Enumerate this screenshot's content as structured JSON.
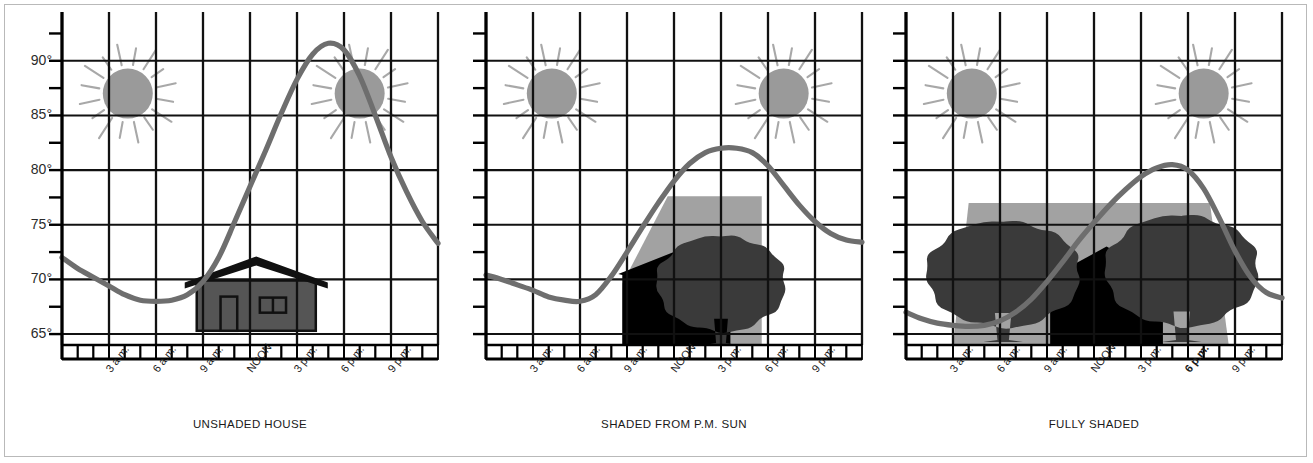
{
  "figure": {
    "title": "",
    "frame_color": "#b9b9b9",
    "background": "#ffffff"
  },
  "colors": {
    "grid": "#111111",
    "axis": "#000000",
    "curve": "#6e6e6e",
    "sun_fill": "#9a9a9a",
    "sun_ray": "#9a9a9a",
    "house_body": "#555555",
    "house_roof": "#111111",
    "house_silhouette": "#000000",
    "tree": "#3a3a3a",
    "shade_light": "#9a9a9a",
    "shade_mid": "#6b6b6b",
    "text": "#1a1a1a"
  },
  "axis": {
    "y_ticks_major": [
      "65°",
      "70°",
      "75°",
      "80°",
      "85°",
      "90°"
    ],
    "y_values_major": [
      65,
      70,
      75,
      80,
      85,
      90
    ],
    "y_minor_values": [
      67.5,
      72.5,
      77.5,
      82.5,
      87.5,
      92.5
    ],
    "y_min": 64,
    "y_max": 93,
    "x_min": 0,
    "x_max": 24,
    "x_hour_boxes": 24,
    "x_gridline_hours": [
      0,
      3,
      6,
      9,
      12,
      15,
      18,
      21,
      24
    ],
    "x_tick_labels": [
      {
        "hour": 3,
        "label": "3 a.m."
      },
      {
        "hour": 6,
        "label": "6 a.m."
      },
      {
        "hour": 9,
        "label": "9 a.m."
      },
      {
        "hour": 12,
        "label": "NOON"
      },
      {
        "hour": 15,
        "label": "3 p.m."
      },
      {
        "hour": 18,
        "label": "6 p.m."
      },
      {
        "hour": 21,
        "label": "9 p.m."
      }
    ]
  },
  "panels": [
    {
      "id": "unshaded-house",
      "caption": "UNSHADED HOUSE",
      "suns": [
        {
          "hour": 4.2,
          "temp": 87.0
        },
        {
          "hour": 19.0,
          "temp": 87.0
        }
      ],
      "scene": "house-plain",
      "chart_data": {
        "type": "line",
        "title": "UNSHADED HOUSE",
        "xlabel": "",
        "ylabel": "Temperature (°F)",
        "ylim": [
          64,
          93
        ],
        "xlim": [
          0,
          24
        ],
        "grid": true,
        "legend": "none",
        "x": [
          0,
          1,
          2,
          3,
          4,
          5,
          6,
          7,
          8,
          9,
          10,
          11,
          12,
          13,
          14,
          15,
          16,
          17,
          18,
          19,
          20,
          21,
          22,
          23,
          24
        ],
        "y": [
          72.0,
          71.0,
          70.2,
          69.4,
          68.6,
          68.1,
          68.0,
          68.1,
          68.6,
          69.8,
          72.0,
          75.2,
          78.5,
          81.8,
          85.2,
          88.3,
          90.6,
          91.6,
          91.0,
          88.6,
          85.0,
          81.2,
          78.0,
          75.3,
          73.3
        ]
      }
    },
    {
      "id": "shaded-from-pm-sun",
      "caption": "SHADED FROM P.M. SUN",
      "suns": [
        {
          "hour": 4.2,
          "temp": 87.0
        },
        {
          "hour": 19.0,
          "temp": 87.0
        }
      ],
      "scene": "house-one-tree",
      "chart_data": {
        "type": "line",
        "title": "SHADED FROM P.M. SUN",
        "xlabel": "",
        "ylabel": "Temperature (°F)",
        "ylim": [
          64,
          93
        ],
        "xlim": [
          0,
          24
        ],
        "grid": true,
        "legend": "none",
        "x": [
          0,
          1,
          2,
          3,
          4,
          5,
          6,
          7,
          8,
          9,
          10,
          11,
          12,
          13,
          14,
          15,
          16,
          17,
          18,
          19,
          20,
          21,
          22,
          23,
          24
        ],
        "y": [
          70.4,
          70.0,
          69.5,
          69.0,
          68.4,
          68.1,
          68.0,
          68.6,
          70.3,
          72.5,
          74.8,
          77.0,
          79.0,
          80.6,
          81.6,
          82.0,
          82.0,
          81.6,
          80.4,
          78.6,
          76.8,
          75.3,
          74.2,
          73.6,
          73.4
        ]
      }
    },
    {
      "id": "fully-shaded",
      "caption": "FULLY SHADED",
      "suns": [
        {
          "hour": 4.2,
          "temp": 87.0
        },
        {
          "hour": 19.0,
          "temp": 87.0
        }
      ],
      "scene": "house-two-trees",
      "chart_data": {
        "type": "line",
        "title": "FULLY SHADED",
        "xlabel": "",
        "ylabel": "Temperature (°F)",
        "ylim": [
          64,
          93
        ],
        "xlim": [
          0,
          24
        ],
        "grid": true,
        "legend": "none",
        "x": [
          0,
          1,
          2,
          3,
          4,
          5,
          6,
          7,
          8,
          9,
          10,
          11,
          12,
          13,
          14,
          15,
          16,
          17,
          18,
          19,
          20,
          21,
          22,
          23,
          24
        ],
        "y": [
          67.0,
          66.4,
          66.0,
          65.8,
          65.7,
          65.8,
          66.2,
          67.0,
          68.2,
          69.8,
          71.6,
          73.5,
          75.2,
          76.8,
          78.2,
          79.4,
          80.2,
          80.5,
          80.0,
          78.3,
          75.6,
          72.6,
          70.2,
          68.8,
          68.3
        ]
      }
    }
  ]
}
